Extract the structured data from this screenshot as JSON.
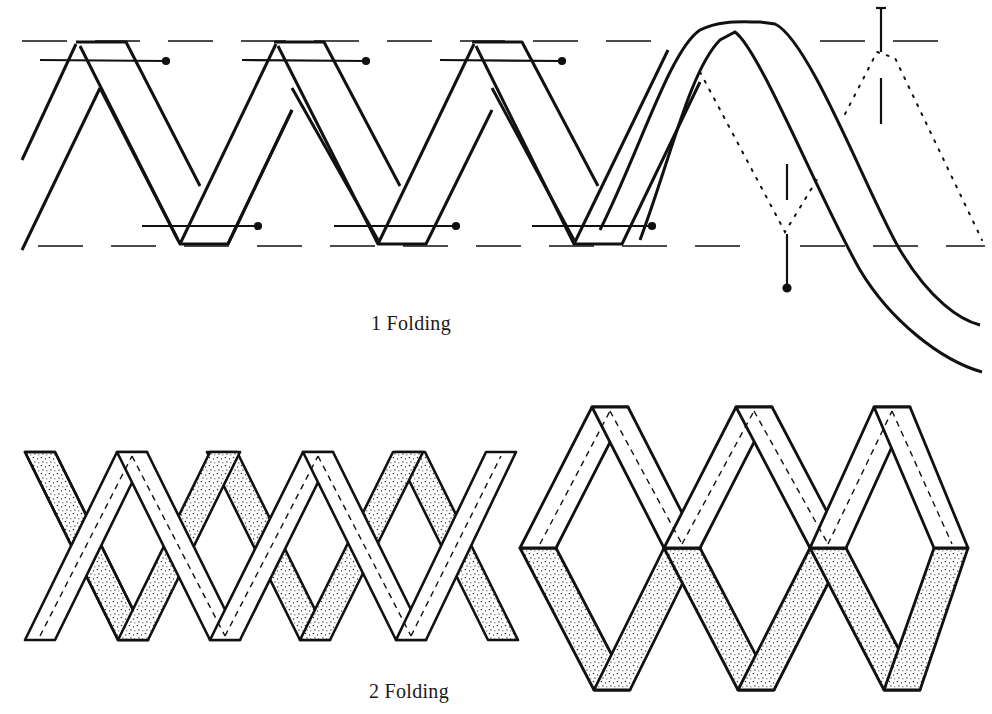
{
  "figure": {
    "panels": [
      {
        "id": 1,
        "caption_number": "1",
        "caption": "1 Folding",
        "description": "Zigzag tape folded back and forth between two dashed guide lines, held with pins; right end shows the unfolded strip arching over with dotted fold lines"
      },
      {
        "id": 2,
        "caption_number": "2",
        "caption": "2 Folding",
        "description": "Two finished lattice/diamond arrangements of folded strips with stippled (reverse) sides and dashed stitch lines"
      }
    ],
    "colors": {
      "ink": "#111111",
      "paper": "#ffffff",
      "stipple": "#555555"
    }
  }
}
